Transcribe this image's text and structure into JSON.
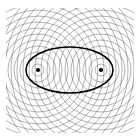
{
  "figure": {
    "caption_clipped": "ty=1",
    "background_color": "#ffffff",
    "width": 140,
    "height": 140
  },
  "chart_data": {
    "type": "scatter",
    "xlabel": "",
    "ylabel": "",
    "xlim": [
      0,
      140
    ],
    "ylim": [
      0,
      140
    ],
    "grid": false,
    "legend_position": "none",
    "plot_area": {
      "x": 6,
      "y": 8,
      "width": 128,
      "height": 125
    },
    "foci": [
      {
        "name": "left-focus",
        "x": 38,
        "y": 70,
        "radius": 2.1,
        "color": "#000000"
      },
      {
        "name": "right-focus",
        "x": 101,
        "y": 70,
        "radius": 2.1,
        "color": "#000000"
      }
    ],
    "ellipse": {
      "name": "envelope-ellipse",
      "cx": 69.5,
      "cy": 70,
      "rx": 43.5,
      "ry": 23,
      "stroke": "#000000",
      "stroke_width": 1.5,
      "fill": "none"
    },
    "circle_families": [
      {
        "name": "left-circle-family",
        "center_x": 38,
        "center_y": 70,
        "color": "#555555",
        "stroke_width": 0.45,
        "radii": [
          6,
          12,
          18,
          24,
          30,
          36,
          42,
          48,
          54,
          60,
          66,
          72,
          78,
          84,
          90,
          96,
          102
        ]
      },
      {
        "name": "right-circle-family",
        "center_x": 101,
        "center_y": 70,
        "color": "#555555",
        "stroke_width": 0.45,
        "radii": [
          6,
          12,
          18,
          24,
          30,
          36,
          42,
          48,
          54,
          60,
          66,
          72,
          78,
          84,
          90,
          96,
          102
        ]
      }
    ],
    "clip_region": {
      "x": 6,
      "y": 8,
      "width": 128,
      "height": 125
    }
  }
}
